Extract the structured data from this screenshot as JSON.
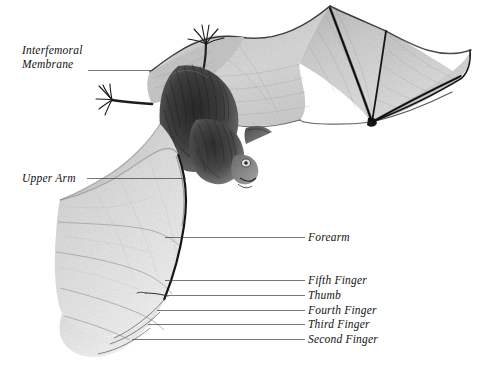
{
  "figure": {
    "medium": "graphite pencil drawing",
    "background_color": "#ffffff",
    "ink_color": "#121212",
    "leader_line_color": "#4a4a4a"
  },
  "labels": {
    "interfemoral_membrane_line1": "Interfemoral",
    "interfemoral_membrane_line2": "Membrane",
    "upper_arm": "Upper Arm",
    "forearm": "Forearm",
    "fifth_finger": "Fifth Finger",
    "thumb": "Thumb",
    "fourth_finger": "Fourth Finger",
    "third_finger": "Third Finger",
    "second_finger": "Second Finger"
  },
  "anatomy_parts": [
    "Interfemoral Membrane",
    "Upper Arm",
    "Forearm",
    "Fifth Finger",
    "Thumb",
    "Fourth Finger",
    "Third Finger",
    "Second Finger"
  ]
}
